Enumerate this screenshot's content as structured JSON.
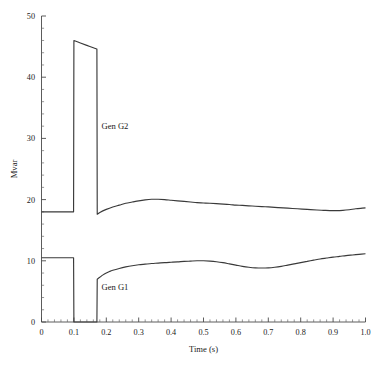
{
  "chart_data": {
    "type": "line",
    "title": "",
    "xlabel": "Time (s)",
    "ylabel": "Mvar",
    "xlim": [
      0,
      1.0
    ],
    "ylim": [
      0,
      50
    ],
    "grid": false,
    "legend_position": "inline-annotations",
    "xticks": [
      0,
      0.1,
      0.2,
      0.3,
      0.4,
      0.5,
      0.6,
      0.7,
      0.8,
      0.9,
      1.0
    ],
    "xtick_labels": [
      "0",
      "0.1",
      "0.2",
      "0.3",
      "0.4",
      "0.5",
      "0.6",
      "0.7",
      "0.8",
      "0.9",
      "1.0"
    ],
    "xminor_step": 0.02,
    "yticks": [
      0,
      10,
      20,
      30,
      40,
      50
    ],
    "ytick_labels": [
      "0",
      "10",
      "20",
      "30",
      "40",
      "50"
    ],
    "yminor_step": 2,
    "annotations": [
      {
        "text": "Gen G2",
        "x": 0.185,
        "y": 31.5
      },
      {
        "text": "Gen G1",
        "x": 0.185,
        "y": 5.3
      }
    ],
    "line_color": "#3a3a3a",
    "axis_color": "#4a4a4a",
    "series": [
      {
        "name": "Gen G2",
        "points": [
          [
            0.0,
            18.0
          ],
          [
            0.05,
            18.0
          ],
          [
            0.099,
            18.0
          ],
          [
            0.1,
            46.0
          ],
          [
            0.12,
            45.6
          ],
          [
            0.14,
            45.2
          ],
          [
            0.16,
            44.8
          ],
          [
            0.171,
            44.6
          ],
          [
            0.172,
            17.6
          ],
          [
            0.18,
            17.9
          ],
          [
            0.2,
            18.4
          ],
          [
            0.22,
            18.8
          ],
          [
            0.24,
            19.1
          ],
          [
            0.26,
            19.4
          ],
          [
            0.28,
            19.6
          ],
          [
            0.3,
            19.8
          ],
          [
            0.32,
            19.95
          ],
          [
            0.34,
            20.05
          ],
          [
            0.36,
            20.05
          ],
          [
            0.38,
            20.0
          ],
          [
            0.4,
            19.9
          ],
          [
            0.42,
            19.8
          ],
          [
            0.44,
            19.7
          ],
          [
            0.46,
            19.6
          ],
          [
            0.48,
            19.5
          ],
          [
            0.5,
            19.45
          ],
          [
            0.52,
            19.4
          ],
          [
            0.55,
            19.3
          ],
          [
            0.58,
            19.2
          ],
          [
            0.6,
            19.1
          ],
          [
            0.62,
            19.05
          ],
          [
            0.65,
            18.95
          ],
          [
            0.68,
            18.85
          ],
          [
            0.7,
            18.8
          ],
          [
            0.73,
            18.7
          ],
          [
            0.76,
            18.6
          ],
          [
            0.79,
            18.5
          ],
          [
            0.82,
            18.4
          ],
          [
            0.85,
            18.3
          ],
          [
            0.87,
            18.25
          ],
          [
            0.89,
            18.2
          ],
          [
            0.91,
            18.2
          ],
          [
            0.93,
            18.25
          ],
          [
            0.95,
            18.35
          ],
          [
            0.97,
            18.5
          ],
          [
            0.99,
            18.6
          ],
          [
            1.0,
            18.65
          ]
        ]
      },
      {
        "name": "Gen G1",
        "points": [
          [
            0.0,
            10.5
          ],
          [
            0.05,
            10.5
          ],
          [
            0.099,
            10.5
          ],
          [
            0.1,
            0.0
          ],
          [
            0.171,
            0.0
          ],
          [
            0.172,
            7.0
          ],
          [
            0.18,
            7.3
          ],
          [
            0.19,
            7.7
          ],
          [
            0.2,
            8.0
          ],
          [
            0.21,
            8.25
          ],
          [
            0.22,
            8.45
          ],
          [
            0.24,
            8.75
          ],
          [
            0.26,
            9.0
          ],
          [
            0.28,
            9.2
          ],
          [
            0.3,
            9.35
          ],
          [
            0.32,
            9.45
          ],
          [
            0.34,
            9.55
          ],
          [
            0.36,
            9.62
          ],
          [
            0.38,
            9.7
          ],
          [
            0.4,
            9.76
          ],
          [
            0.42,
            9.82
          ],
          [
            0.44,
            9.9
          ],
          [
            0.46,
            9.95
          ],
          [
            0.48,
            10.0
          ],
          [
            0.5,
            10.0
          ],
          [
            0.52,
            9.95
          ],
          [
            0.54,
            9.85
          ],
          [
            0.56,
            9.7
          ],
          [
            0.58,
            9.5
          ],
          [
            0.6,
            9.3
          ],
          [
            0.62,
            9.1
          ],
          [
            0.64,
            8.95
          ],
          [
            0.66,
            8.85
          ],
          [
            0.68,
            8.82
          ],
          [
            0.7,
            8.85
          ],
          [
            0.72,
            8.95
          ],
          [
            0.74,
            9.1
          ],
          [
            0.76,
            9.3
          ],
          [
            0.78,
            9.5
          ],
          [
            0.8,
            9.7
          ],
          [
            0.82,
            9.9
          ],
          [
            0.84,
            10.1
          ],
          [
            0.86,
            10.3
          ],
          [
            0.88,
            10.45
          ],
          [
            0.9,
            10.6
          ],
          [
            0.92,
            10.72
          ],
          [
            0.94,
            10.85
          ],
          [
            0.96,
            10.95
          ],
          [
            0.98,
            11.05
          ],
          [
            1.0,
            11.15
          ]
        ]
      }
    ]
  }
}
